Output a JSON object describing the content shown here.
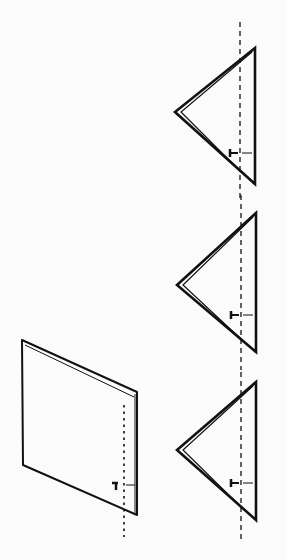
{
  "figure": {
    "colors": {
      "ink": "#111111",
      "paper": "#fbfbfb"
    },
    "sheet": {
      "outer": [
        [
          22,
          340
        ],
        [
          137,
          392
        ],
        [
          137,
          515
        ],
        [
          23,
          465
        ]
      ],
      "inner_edge": [
        [
          25,
          342
        ],
        [
          134,
          394
        ]
      ],
      "fold_line": {
        "x": 124,
        "y1": 405,
        "y2": 537,
        "style": "dotted"
      },
      "marker": {
        "x": 116,
        "y": 487
      }
    },
    "triangles": [
      {
        "top": [
          255,
          48
        ],
        "left": [
          175,
          112
        ],
        "bottom": [
          255,
          184
        ],
        "fold_line_x": 240,
        "fold_y1": 22,
        "fold_y2": 200,
        "marker_y": 153
      },
      {
        "top": [
          256,
          213
        ],
        "left": [
          177,
          285
        ],
        "bottom": [
          256,
          352
        ],
        "fold_line_x": 241,
        "fold_y1": 195,
        "fold_y2": 370,
        "marker_y": 315
      },
      {
        "top": [
          256,
          382
        ],
        "left": [
          177,
          450
        ],
        "bottom": [
          256,
          520
        ],
        "fold_line_x": 241,
        "fold_y1": 372,
        "fold_y2": 543,
        "marker_y": 483
      }
    ]
  }
}
